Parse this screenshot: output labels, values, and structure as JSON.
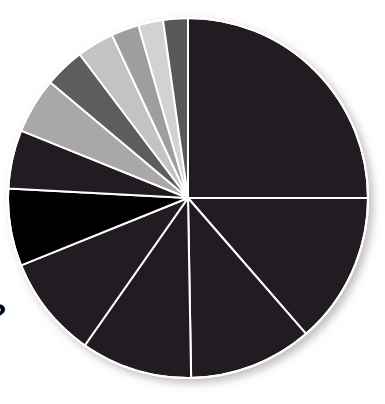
{
  "figure": {
    "cut_off_title": "o?",
    "background_color": "#ffffff"
  },
  "chart_data": {
    "type": "pie",
    "title": "o?",
    "xlabel": "",
    "ylabel": "",
    "legend": "none",
    "grid": false,
    "start_angle_deg": 0,
    "direction": "clockwise",
    "center_px": [
      188,
      198
    ],
    "radius_px": 180,
    "labels": [
      "Slice 1",
      "Slice 2",
      "Slice 3",
      "Slice 4",
      "Slice 5",
      "Slice 6",
      "Slice 7",
      "Slice 8",
      "Slice 9",
      "Slice 10",
      "Slice 11",
      "Slice 12",
      "Slice 13"
    ],
    "values": [
      25.0,
      13.6,
      11.1,
      10.0,
      9.2,
      6.9,
      5.3,
      5.0,
      3.6,
      3.3,
      2.5,
      2.2,
      2.3
    ],
    "angles_deg": [
      90.0,
      49.0,
      40.0,
      36.0,
      33.0,
      25.0,
      19.0,
      18.0,
      13.0,
      12.0,
      9.0,
      8.0,
      8.0
    ],
    "colors": [
      "#231f20",
      "#231f20",
      "#231f20",
      "#231f20",
      "#231f20",
      "#000000",
      "#231f20",
      "#a8a8a8",
      "#5d5d5d",
      "#c3c3c3",
      "#9e9e9e",
      "#d2d2d2",
      "#585858"
    ],
    "slice_border_color": "#ffffff",
    "slice_border_width_px": 2
  }
}
